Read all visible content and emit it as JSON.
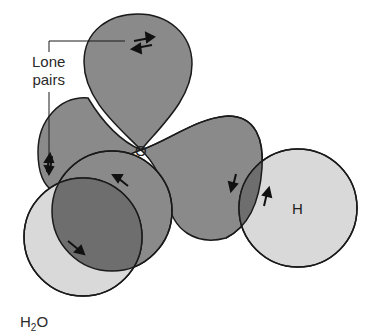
{
  "diagram": {
    "title": "H2O",
    "title_main": "H",
    "title_sub": "2",
    "title_tail": "O",
    "annotation": {
      "line1": "Lone",
      "line2": "pairs"
    },
    "atoms": {
      "oxygen": "O",
      "hydrogen": "H"
    },
    "colors": {
      "lobe_dark": "#8a8a8a",
      "overlap": "#6e6e6e",
      "hydrogen_light": "#d9d9d9",
      "outline": "#1a1a1a"
    }
  }
}
